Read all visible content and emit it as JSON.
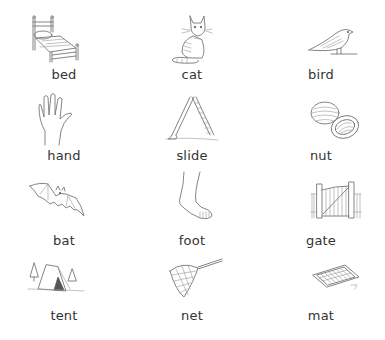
{
  "worksheet": {
    "layout": {
      "rows": 4,
      "columns": 3
    },
    "cards": [
      {
        "word": "bed",
        "icon": "bed-icon"
      },
      {
        "word": "cat",
        "icon": "cat-icon"
      },
      {
        "word": "bird",
        "icon": "bird-icon"
      },
      {
        "word": "hand",
        "icon": "hand-icon"
      },
      {
        "word": "slide",
        "icon": "slide-icon"
      },
      {
        "word": "nut",
        "icon": "nut-icon"
      },
      {
        "word": "bat",
        "icon": "bat-icon"
      },
      {
        "word": "foot",
        "icon": "foot-icon"
      },
      {
        "word": "gate",
        "icon": "gate-icon"
      },
      {
        "word": "tent",
        "icon": "tent-icon"
      },
      {
        "word": "net",
        "icon": "net-icon"
      },
      {
        "word": "mat",
        "icon": "mat-icon"
      }
    ],
    "colors": {
      "text": "#333333",
      "line_art": "#777777",
      "background": "#ffffff"
    }
  }
}
